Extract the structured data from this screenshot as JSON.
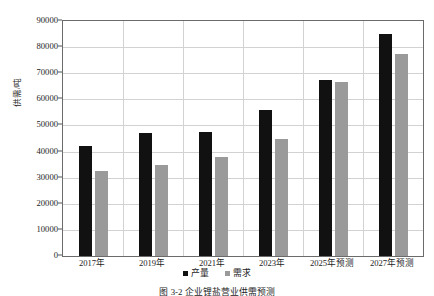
{
  "chart_data": {
    "type": "bar",
    "title": "",
    "xlabel": "",
    "ylabel": "供需/吨",
    "ylim": [
      0,
      90000
    ],
    "ytick_step": 10000,
    "grid": true,
    "legend_position": "bottom",
    "categories": [
      "2017年",
      "2019年",
      "2021年",
      "2023年",
      "2025年预测",
      "2027年预测"
    ],
    "ytick_labels": [
      "0",
      "10000",
      "20000",
      "30000",
      "40000",
      "50000",
      "60000",
      "70000",
      "80000",
      "90000"
    ],
    "series": [
      {
        "name": "产量",
        "color": "#111111",
        "values": [
          42000,
          47000,
          47500,
          56000,
          67500,
          85000
        ]
      },
      {
        "name": "需求",
        "color": "#9a9a9a",
        "values": [
          32500,
          35000,
          38000,
          45000,
          66500,
          77500
        ]
      }
    ]
  },
  "legend": {
    "items": [
      {
        "label": "产量",
        "swatch": "legend-swatch-black"
      },
      {
        "label": "需求",
        "swatch": "legend-swatch-gray"
      }
    ]
  },
  "caption": {
    "text": "图 3-2   企业锂盐营业供需预测"
  },
  "colors": {
    "production": "#111111",
    "demand": "#9a9a9a",
    "gridline": "#d2d2d2",
    "axis": "#6b6b6b",
    "text": "#1c1c1c",
    "background": "#ffffff"
  }
}
